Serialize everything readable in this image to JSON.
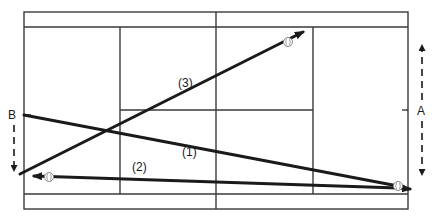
{
  "diagram": {
    "type": "tennis-court-shot-diagram",
    "court": {
      "outer": {
        "x1": 24,
        "y1": 12,
        "x2": 408,
        "y2": 209
      },
      "doubles_alleys_y": [
        27,
        194
      ],
      "service_lines_x": [
        120,
        313
      ],
      "net_x": 216,
      "center_service_line_y": 110,
      "line_color": "#3a3a3a"
    },
    "positions": [
      {
        "id": "B",
        "label": "B",
        "x": 8,
        "y": 117,
        "tick_y": 115,
        "movement": "down"
      },
      {
        "id": "A",
        "label": "A",
        "x": 417,
        "y": 114,
        "tick_y": 110,
        "movement": "up-and-down"
      }
    ],
    "shots": [
      {
        "id": "1",
        "label": "(1)",
        "from": [
          24,
          115
        ],
        "to": [
          398,
          186
        ],
        "label_pos": [
          190,
          150
        ]
      },
      {
        "id": "2",
        "label": "(2)",
        "from": [
          398,
          188
        ],
        "to": [
          28,
          176
        ],
        "label_pos": [
          133,
          174
        ]
      },
      {
        "id": "3",
        "label": "(3)",
        "from": [
          20,
          174
        ],
        "to": [
          310,
          28
        ],
        "label_pos": [
          178,
          84
        ]
      }
    ],
    "balls": [
      {
        "near": "shot-3-end",
        "x": 288,
        "y": 42
      },
      {
        "near": "shot-2-end",
        "x": 49,
        "y": 177
      },
      {
        "near": "shot-1-end",
        "x": 398,
        "y": 186
      }
    ],
    "colors": {
      "ink": "#1a1a1a",
      "ball_outline": "#8a8a8a",
      "background": "#ffffff"
    }
  }
}
